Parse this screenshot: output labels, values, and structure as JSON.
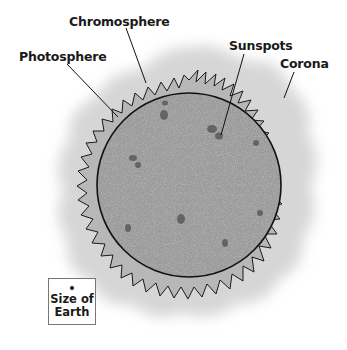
{
  "labels": {
    "chromosphere": "Chromosphere",
    "photosphere": "Photosphere",
    "sunspots": "Sunspots",
    "corona": "Corona"
  },
  "scale_box": {
    "text": "Size of\nEarth"
  },
  "colors": {
    "corona": "#d8d8d8",
    "chromosphere": "#b4b4b4",
    "photosphere": "#9a9a9a",
    "sunspot": "#5e5e5e",
    "outline": "#111111"
  }
}
